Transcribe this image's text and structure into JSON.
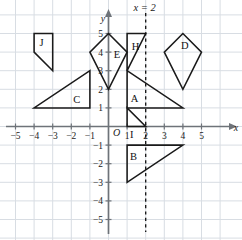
{
  "figure": {
    "title_annotation": "x = 2",
    "axes": {
      "x_label": "x",
      "y_label": "y",
      "origin_label": "O",
      "x_ticks": [
        "−5",
        "−4",
        "−3",
        "−2",
        "−1",
        "1",
        "2",
        "3",
        "4",
        "5"
      ],
      "y_ticks": [
        "5",
        "4",
        "3",
        "2",
        "1",
        "−1",
        "−2",
        "−3",
        "−4",
        "−5"
      ],
      "xlim": [
        -6,
        6
      ],
      "ylim": [
        -6,
        6
      ]
    },
    "colors": {
      "grid": "#d8dde3",
      "axis": "#6e7379",
      "shape_stroke": "#1a1a1a",
      "background": "#ffffff",
      "mirror_line": "#111111"
    },
    "mirror_line": {
      "equation": "x = 2",
      "x_value": 2,
      "style": "dashed"
    }
  },
  "chart_data": {
    "type": "scatter",
    "title": "x = 2",
    "xlabel": "x",
    "ylabel": "y",
    "xlim": [
      -6,
      6
    ],
    "ylim": [
      -6,
      6
    ],
    "grid": true,
    "legend": "none",
    "annotations": [
      "x = 2"
    ],
    "shapes": [
      {
        "label": "J",
        "kind": "quadrilateral",
        "vertices": [
          [
            -4,
            5
          ],
          [
            -3,
            5
          ],
          [
            -3,
            3
          ],
          [
            -4,
            4
          ]
        ],
        "label_position": [
          -3.6,
          4.5
        ]
      },
      {
        "label": "E",
        "kind": "kite",
        "vertices": [
          [
            0,
            5
          ],
          [
            -1,
            4
          ],
          [
            0,
            2
          ],
          [
            1,
            4
          ]
        ],
        "label_position": [
          0.45,
          3.9
        ]
      },
      {
        "label": "H",
        "kind": "triangle",
        "vertices": [
          [
            1,
            5
          ],
          [
            2,
            5
          ],
          [
            1,
            3
          ]
        ],
        "label_position": [
          1.45,
          4.3
        ]
      },
      {
        "label": "D",
        "kind": "kite",
        "vertices": [
          [
            4,
            5
          ],
          [
            3,
            4
          ],
          [
            4,
            2
          ],
          [
            5,
            4
          ]
        ],
        "label_position": [
          4.1,
          4.35
        ]
      },
      {
        "label": "C",
        "kind": "triangle",
        "vertices": [
          [
            -4,
            1
          ],
          [
            -1,
            1
          ],
          [
            -1,
            3
          ]
        ],
        "label_position": [
          -1.7,
          1.45
        ]
      },
      {
        "label": "A",
        "kind": "triangle",
        "vertices": [
          [
            1,
            3
          ],
          [
            1,
            1
          ],
          [
            4,
            1
          ]
        ],
        "label_position": [
          1.4,
          1.5
        ]
      },
      {
        "label": "I",
        "kind": "triangle",
        "vertices": [
          [
            1,
            1
          ],
          [
            1,
            0
          ],
          [
            2,
            0
          ]
        ],
        "label_position": [
          1.25,
          -0.45
        ]
      },
      {
        "label": "B",
        "kind": "triangle",
        "vertices": [
          [
            1,
            -1
          ],
          [
            4,
            -1
          ],
          [
            1,
            -3
          ]
        ],
        "label_position": [
          1.35,
          -1.6
        ]
      }
    ]
  }
}
